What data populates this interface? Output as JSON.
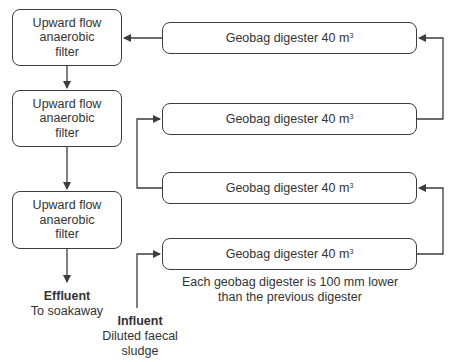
{
  "diagram": {
    "filters": [
      {
        "line1": "Upward flow",
        "line2": "anaerobic",
        "line3": "filter"
      },
      {
        "line1": "Upward flow",
        "line2": "anaerobic",
        "line3": "filter"
      },
      {
        "line1": "Upward flow",
        "line2": "anaerobic",
        "line3": "filter"
      }
    ],
    "digesters": [
      {
        "label": "Geobag digester 40 m",
        "unit_sup": "3"
      },
      {
        "label": "Geobag digester 40 m",
        "unit_sup": "3"
      },
      {
        "label": "Geobag digester 40 m",
        "unit_sup": "3"
      },
      {
        "label": "Geobag digester 40 m",
        "unit_sup": "3"
      }
    ],
    "effluent": {
      "title": "Effluent",
      "subtitle": "To soakaway"
    },
    "influent": {
      "title": "Influent",
      "subtitle_line1": "Diluted faecal",
      "subtitle_line2": "sludge"
    },
    "note": {
      "line1": "Each geobag digester is 100 mm lower",
      "line2": "than the previous digester"
    },
    "colors": {
      "line": "#3c3c3c",
      "text": "#333333",
      "background": "#ffffff"
    }
  }
}
